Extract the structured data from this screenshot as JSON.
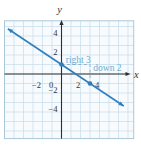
{
  "chart_data": {
    "type": "line",
    "title": "",
    "xlabel": "x",
    "ylabel": "y",
    "xlim": [
      -6,
      7.6
    ],
    "ylim": [
      -6.8,
      5.6
    ],
    "grid": true,
    "grid_step": 1,
    "legend": null,
    "x_ticks": [
      {
        "value": -2,
        "label": "−2"
      },
      {
        "value": 0,
        "label": "0"
      },
      {
        "value": 2,
        "label": "2"
      },
      {
        "value": 4,
        "label": "4"
      }
    ],
    "y_ticks": [
      {
        "value": 4,
        "label": "4"
      },
      {
        "value": 2,
        "label": "2"
      },
      {
        "value": -2,
        "label": "−2"
      },
      {
        "value": -4,
        "label": "−4"
      }
    ],
    "series": [
      {
        "name": "line",
        "slope_rise": -2,
        "slope_run": 3,
        "y_intercept": 1,
        "marked_points": [
          {
            "x": 0,
            "y": 1
          },
          {
            "x": 3,
            "y": -1
          }
        ],
        "x_extent": [
          -5.65,
          6.55
        ],
        "arrows": "both"
      }
    ],
    "slope_triangle": {
      "dashed_path": [
        {
          "x": 0,
          "y": 1
        },
        {
          "x": 3,
          "y": 1
        },
        {
          "x": 3,
          "y": -1
        }
      ],
      "annotations": [
        {
          "text": "right 3",
          "x": 0.45,
          "y": 1.2,
          "anchor": "start"
        },
        {
          "text": "down 2",
          "x": 3.35,
          "y": 0.35,
          "anchor": "start"
        }
      ]
    },
    "colors": {
      "line": "#2e7fbe",
      "annotation_text": "#66aed6",
      "dashed": "#8fb4cc",
      "grid": "#c6dbe8",
      "grid_border": "#a9c8d8",
      "axis": "#2e2e2e",
      "tick_text": "#333333",
      "plot_background": "#f8fbfd",
      "page_background": "#ffffff"
    }
  }
}
